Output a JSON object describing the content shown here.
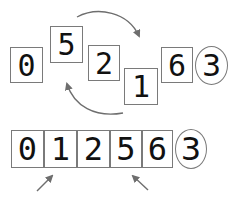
{
  "diagram": {
    "top_row": {
      "cells": [
        {
          "value": "0",
          "x": 10,
          "y": 47,
          "w": 33,
          "h": 36,
          "fs": 30
        },
        {
          "value": "5",
          "x": 50,
          "y": 26,
          "w": 33,
          "h": 37,
          "fs": 30
        },
        {
          "value": "2",
          "x": 88,
          "y": 45,
          "w": 32,
          "h": 36,
          "fs": 30
        },
        {
          "value": "1",
          "x": 124,
          "y": 68,
          "w": 34,
          "h": 37,
          "fs": 30
        },
        {
          "value": "6",
          "x": 161,
          "y": 47,
          "w": 32,
          "h": 36,
          "fs": 30
        }
      ],
      "pending": {
        "value": "3",
        "x": 195,
        "y": 46,
        "w": 33,
        "h": 39,
        "fs": 30
      }
    },
    "bottom_row": {
      "cells": [
        {
          "value": "0",
          "x": 11,
          "y": 130,
          "w": 33,
          "h": 38,
          "fs": 32
        },
        {
          "value": "1",
          "x": 44,
          "y": 130,
          "w": 33,
          "h": 38,
          "fs": 32
        },
        {
          "value": "2",
          "x": 77,
          "y": 130,
          "w": 33,
          "h": 38,
          "fs": 32
        },
        {
          "value": "5",
          "x": 110,
          "y": 130,
          "w": 32,
          "h": 38,
          "fs": 32
        },
        {
          "value": "6",
          "x": 142,
          "y": 130,
          "w": 31,
          "h": 38,
          "fs": 32
        }
      ],
      "pending": {
        "value": "3",
        "x": 175,
        "y": 129,
        "w": 32,
        "h": 40,
        "fs": 32
      }
    },
    "colors": {
      "border": "#7a7a7a",
      "arrow": "#6e6e6e",
      "text": "#111111"
    }
  }
}
